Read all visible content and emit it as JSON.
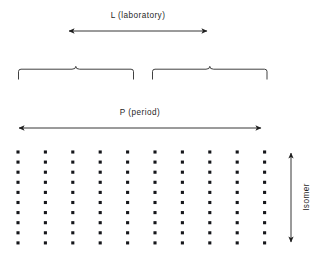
{
  "figure": {
    "title": "",
    "background_color": "#ffffff",
    "ink_color": "#1f1f1f",
    "dot_color": "#15161a",
    "width": 327,
    "height": 254
  },
  "labels": {
    "laboratory": "L (laboratory)",
    "period": "P (period)",
    "isomer": "Isomer"
  },
  "chart_data": {
    "type": "scatter",
    "title": "",
    "xlabel": "P (period)",
    "ylabel": "Isomer",
    "grid": false,
    "legend": false,
    "annotations": [
      {
        "name": "laboratory-span",
        "text": "L (laboratory)",
        "kind": "double-arrow",
        "orientation": "horizontal",
        "x_start": 68,
        "x_end": 208,
        "y": 31
      },
      {
        "name": "period-span",
        "text": "P (period)",
        "kind": "double-arrow",
        "orientation": "horizontal",
        "x_start": 18,
        "x_end": 262,
        "y": 128
      },
      {
        "name": "isomer-axis",
        "text": "Isomer",
        "kind": "double-arrow",
        "orientation": "vertical",
        "x": 291,
        "y_start": 152,
        "y_end": 243
      },
      {
        "name": "left-brace",
        "text": "",
        "kind": "brace",
        "x_start": 18,
        "x_end": 134,
        "y": 74,
        "peak_x": 76
      },
      {
        "name": "right-brace",
        "text": "",
        "kind": "brace",
        "x_start": 152,
        "x_end": 267,
        "y": 74,
        "peak_x": 210
      }
    ],
    "grid_points": {
      "columns": 10,
      "rows": 10,
      "x_start": 18,
      "x_step": 27.4,
      "y_start": 152,
      "y_step": 10.1,
      "dot_size": 3.1,
      "x": [
        18,
        45.4,
        72.8,
        100.2,
        127.6,
        155,
        182.4,
        209.8,
        237.2,
        264.6
      ],
      "y": [
        152,
        162.1,
        172.2,
        182.3,
        192.4,
        202.5,
        212.6,
        222.7,
        232.8,
        242.9
      ]
    }
  }
}
